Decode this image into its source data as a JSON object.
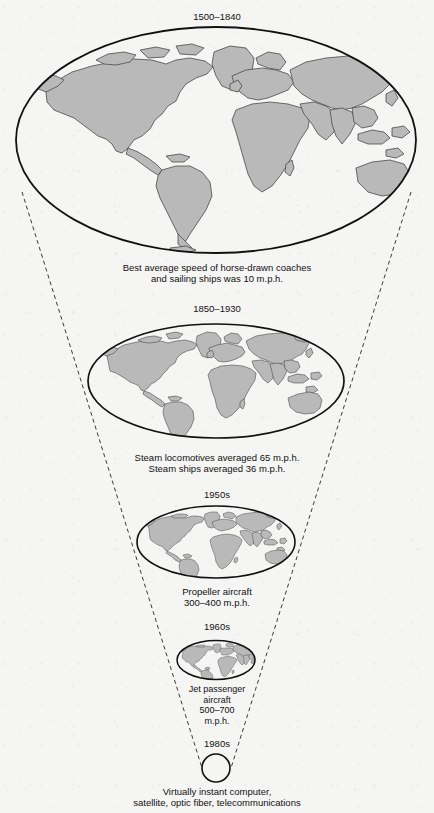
{
  "figure": {
    "type": "time-space-convergence-diagram",
    "background_color": "#f5f5f4",
    "land_color": "#b9b9b9",
    "outline_color": "#1a1a1a",
    "stages": [
      {
        "id": "stage-1",
        "period_label": "1500–1840",
        "caption": "Best average speed of horse-drawn coaches\nand sailing ships was 10 m.p.h.",
        "transport": "horse-drawn coaches and sailing ships",
        "speed_mph": 10,
        "globe": {
          "cx": 216,
          "cy": 140,
          "rx": 201,
          "ry": 114
        }
      },
      {
        "id": "stage-2",
        "period_label": "1850–1930",
        "caption": "Steam locomotives averaged 65 m.p.h.\nSteam ships averaged 36 m.p.h.",
        "transport": "steam locomotives and steam ships",
        "speed_mph": 65,
        "globe": {
          "cx": 216,
          "cy": 381,
          "rx": 129,
          "ry": 58
        }
      },
      {
        "id": "stage-3",
        "period_label": "1950s",
        "caption": "Propeller aircraft\n300–400 m.p.h.",
        "transport": "propeller aircraft",
        "speed_mph": 350,
        "globe": {
          "cx": 216,
          "cy": 542,
          "rx": 80,
          "ry": 37
        }
      },
      {
        "id": "stage-4",
        "period_label": "1960s",
        "caption": "Jet passenger\naircraft\n500–700\nm.p.h.",
        "transport": "jet passenger aircraft",
        "speed_mph": 600,
        "globe": {
          "cx": 216,
          "cy": 660,
          "rx": 40,
          "ry": 20
        }
      },
      {
        "id": "stage-5",
        "period_label": "1980s",
        "caption": "Virtually instant computer,\nsatellite, optic fiber, telecommunications",
        "transport": "computer, satellite, optic fiber, telecommunications",
        "speed_mph": null,
        "globe": {
          "cx": 216,
          "cy": 768,
          "rx": 14,
          "ry": 14
        }
      }
    ]
  }
}
